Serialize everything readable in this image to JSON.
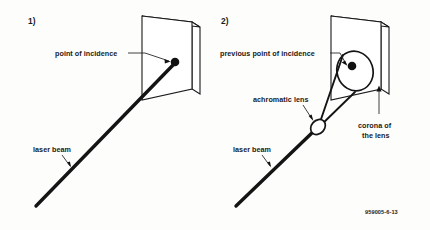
{
  "figure": {
    "background_color": "#fdfdfc",
    "ink_color": "#141414",
    "width": 430,
    "height": 230,
    "reference_code": "959005-6-13"
  },
  "panels": [
    {
      "id": "panel-1",
      "number_label": "1)",
      "labels": {
        "point_of_incidence": "point of incidence",
        "laser_beam": "laser beam"
      }
    },
    {
      "id": "panel-2",
      "number_label": "2)",
      "labels": {
        "previous_point_of_incidence": "previous point of incidence",
        "achromatic_lens": "achromatic lens",
        "corona_of_the_lens_line1": "corona of",
        "corona_of_the_lens_line2": "the lens",
        "laser_beam": "laser beam"
      }
    }
  ]
}
